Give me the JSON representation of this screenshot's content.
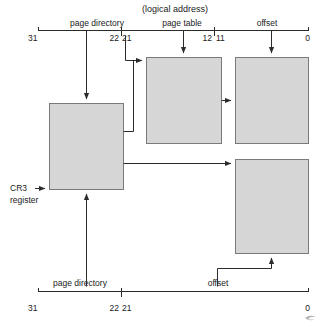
{
  "figure": {
    "title": "(logical address)",
    "top_bar": {
      "fields": [
        {
          "label": "page directory",
          "center_x": 97
        },
        {
          "label": "page table",
          "center_x": 182
        },
        {
          "label": "offset",
          "center_x": 267
        }
      ],
      "ticks": [
        {
          "label": "31",
          "x": 38,
          "align": "left"
        },
        {
          "label": "22",
          "x": 120,
          "align": "right"
        },
        {
          "label": "21",
          "x": 122,
          "align": "left"
        },
        {
          "label": "12",
          "x": 213,
          "align": "right"
        },
        {
          "label": "11",
          "x": 216,
          "align": "left"
        },
        {
          "label": "0",
          "x": 308,
          "align": "right"
        }
      ]
    },
    "bottom_bar": {
      "fields": [
        {
          "label": "page directory",
          "center_x": 80
        },
        {
          "label": "offset",
          "center_x": 218
        }
      ],
      "ticks": [
        {
          "label": "31",
          "x": 38,
          "align": "left"
        },
        {
          "label": "22",
          "x": 120,
          "align": "right"
        },
        {
          "label": "21",
          "x": 122,
          "align": "left"
        },
        {
          "label": "0",
          "x": 308,
          "align": "right"
        }
      ]
    },
    "boxes": [
      {
        "name": "page-directory-box",
        "label": "page\ndirectory",
        "x": 49,
        "y": 103,
        "w": 74,
        "h": 86
      },
      {
        "name": "page-table-box",
        "label": "page\ntable",
        "x": 146,
        "y": 57,
        "w": 75,
        "h": 86
      },
      {
        "name": "four-kb-page-box",
        "label": "4-KB\npage",
        "x": 235,
        "y": 57,
        "w": 73,
        "h": 86
      },
      {
        "name": "four-mb-page-box",
        "label": "4-MB\npage",
        "x": 235,
        "y": 159,
        "w": 73,
        "h": 94
      }
    ],
    "cr3": {
      "line1": "CR3",
      "line2": "register"
    },
    "colors": {
      "box_fill": "#d6d6d6",
      "box_stroke": "#7a7a7a",
      "line": "#2b2b2b",
      "text": "#111111"
    }
  }
}
